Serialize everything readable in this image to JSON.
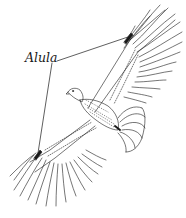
{
  "figure": {
    "labels": [
      {
        "text": "Alula",
        "targets": [
          "upper-alula",
          "lower-alula"
        ]
      }
    ],
    "colors": {
      "ink": "#1a1a1a",
      "background": "#ffffff"
    }
  }
}
